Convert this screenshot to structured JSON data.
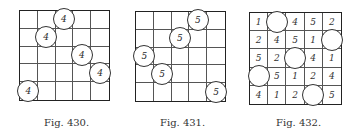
{
  "figures": [
    {
      "caption": "Fig. 430.",
      "cells": [
        [
          "",
          "",
          "(4)",
          "",
          ""
        ],
        [
          "",
          "(4)",
          "",
          "",
          ""
        ],
        [
          "",
          "",
          "",
          "(4)",
          ""
        ],
        [
          "",
          "",
          "",
          "",
          "(4)"
        ],
        [
          "(4)",
          "",
          "",
          "",
          ""
        ]
      ]
    },
    {
      "caption": "Fig. 431.",
      "cells": [
        [
          "",
          "",
          "",
          "(5)",
          ""
        ],
        [
          "",
          "",
          "(5)",
          "",
          ""
        ],
        [
          "(5)",
          "",
          "",
          "",
          ""
        ],
        [
          "",
          "(5)",
          "",
          "",
          ""
        ],
        [
          "",
          "",
          "",
          "",
          "(5)"
        ]
      ]
    },
    {
      "caption": "Fig. 432.",
      "cells": [
        [
          "1",
          "()",
          "4",
          "5",
          "2"
        ],
        [
          "2",
          "4",
          "5",
          "1",
          "()"
        ],
        [
          "5",
          "2",
          "()",
          "4",
          "1"
        ],
        [
          "()",
          "5",
          "1",
          "2",
          "4"
        ],
        [
          "4",
          "1",
          "2",
          "()",
          "5"
        ]
      ]
    }
  ],
  "layout": [
    {
      "left": 19,
      "top": 10,
      "size": 91,
      "captionLeft": 44,
      "captionTop": 117
    },
    {
      "left": 135,
      "top": 11,
      "size": 91,
      "captionLeft": 160,
      "captionTop": 117
    },
    {
      "left": 249,
      "top": 12,
      "size": 93,
      "captionLeft": 276,
      "captionTop": 117
    }
  ]
}
